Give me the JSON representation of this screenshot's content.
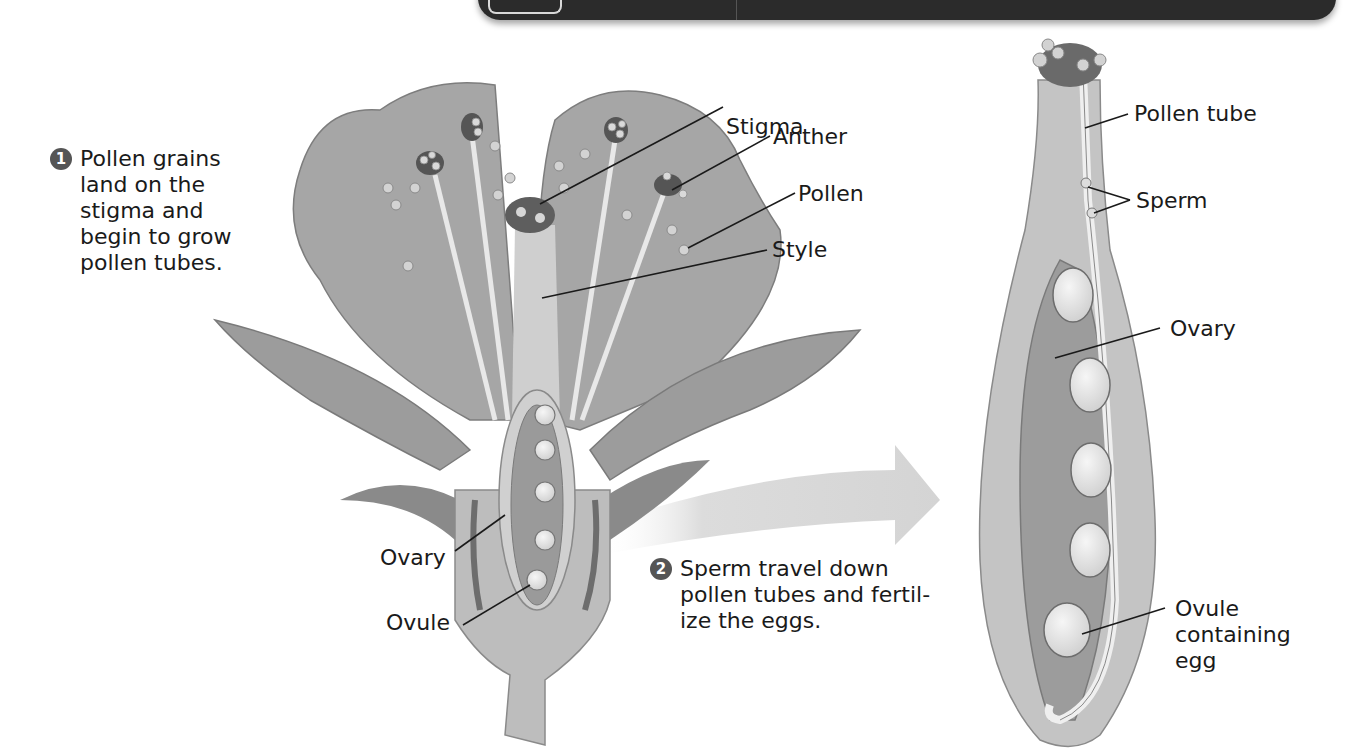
{
  "header_bar": {
    "visible": true,
    "color": "#2b2b2b"
  },
  "steps": [
    {
      "number": "1",
      "lines": [
        "Pollen grains",
        "land on the",
        "stigma and",
        "begin to grow",
        "pollen tubes."
      ]
    },
    {
      "number": "2",
      "lines": [
        "Sperm travel down",
        "pollen tubes and fertil-",
        "ize the eggs."
      ]
    }
  ],
  "flower_labels": {
    "stigma": "Stigma",
    "anther": "Anther",
    "pollen": "Pollen",
    "style": "Style",
    "ovary": "Ovary",
    "ovule": "Ovule"
  },
  "pistil_labels": {
    "pollen_tube": "Pollen tube",
    "sperm": "Sperm",
    "ovary": "Ovary",
    "ovule_containing_egg": [
      "Ovule",
      "containing",
      "egg"
    ]
  },
  "colors": {
    "petal": "#a9a9a9",
    "petal_dark": "#8c8c8c",
    "ovary": "#9a9a9a",
    "tissue_light": "#cfcfcf",
    "ovule": "#e6e6e6",
    "arrow": "#d8d8d8",
    "anther": "#555555"
  }
}
